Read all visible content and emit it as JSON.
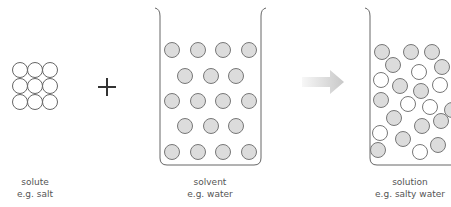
{
  "diagram": {
    "colors": {
      "stroke": "#666666",
      "particle_fill_gray": "#dcdcdc",
      "particle_fill_white": "#ffffff",
      "plus": "#333333",
      "arrow_start": "#f7f7f7",
      "arrow_end": "#c8c8c8",
      "label_text": "#555555"
    },
    "panels": [
      {
        "id": "solute",
        "line1": "solute",
        "line2": "e.g. salt"
      },
      {
        "id": "solvent",
        "line1": "solvent",
        "line2": "e.g. water"
      },
      {
        "id": "solution",
        "line1": "solution",
        "line2": "e.g. salty water"
      }
    ],
    "operator": "plus-icon",
    "transition": "arrow-right-icon"
  }
}
